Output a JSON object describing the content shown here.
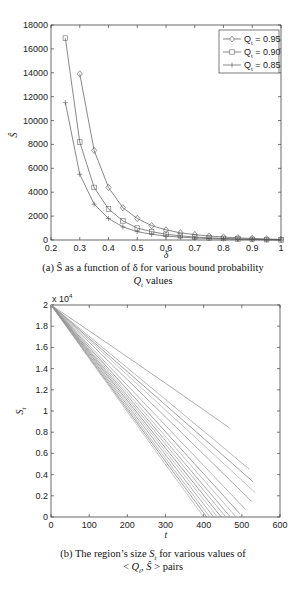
{
  "chart_data": [
    {
      "type": "line",
      "panel": "a",
      "xlabel": "δ",
      "ylabel": "Ŝ",
      "xlim": [
        0.2,
        1
      ],
      "ylim": [
        0,
        18000
      ],
      "xticks": [
        "0.2",
        "0.3",
        "0.4",
        "0.5",
        "0.6",
        "0.7",
        "0.8",
        "0.9",
        "1"
      ],
      "yticks": [
        "0",
        "2000",
        "4000",
        "6000",
        "8000",
        "10000",
        "12000",
        "14000",
        "16000",
        "18000"
      ],
      "grid": false,
      "legend_position": "upper right",
      "series": [
        {
          "name": "Q_t = 0.95",
          "marker": "diamond",
          "x": [
            0.3,
            0.35,
            0.4,
            0.45,
            0.5,
            0.55,
            0.6,
            0.65,
            0.7,
            0.75,
            0.8,
            0.85,
            0.9,
            0.95,
            1.0
          ],
          "y": [
            13900,
            7500,
            4400,
            2700,
            1800,
            1200,
            850,
            600,
            450,
            330,
            250,
            180,
            130,
            90,
            50
          ]
        },
        {
          "name": "Q_t = 0.90",
          "marker": "square",
          "x": [
            0.25,
            0.3,
            0.35,
            0.4,
            0.45,
            0.5,
            0.55,
            0.6,
            0.65,
            0.7,
            0.75,
            0.8,
            0.85,
            0.9,
            0.95,
            1.0
          ],
          "y": [
            16900,
            8200,
            4400,
            2600,
            1600,
            1000,
            700,
            480,
            350,
            250,
            180,
            130,
            90,
            60,
            30,
            10
          ]
        },
        {
          "name": "Q_t = 0.85",
          "marker": "plus",
          "x": [
            0.25,
            0.3,
            0.35,
            0.4,
            0.45,
            0.5,
            0.55,
            0.6,
            0.65,
            0.7,
            0.75,
            0.8,
            0.85,
            0.9,
            0.95,
            1.0
          ],
          "y": [
            11500,
            5500,
            3000,
            1800,
            1100,
            700,
            480,
            330,
            240,
            170,
            120,
            90,
            60,
            40,
            20,
            5
          ]
        }
      ],
      "caption_line1": "(a) Ŝ as a function of δ for various bound probability",
      "caption_line2": "Qt values"
    },
    {
      "type": "line",
      "panel": "b",
      "xlabel": "t",
      "ylabel": "St",
      "y_multiplier": "x 10^4",
      "xlim": [
        0,
        600
      ],
      "ylim": [
        0,
        2
      ],
      "xticks": [
        "0",
        "100",
        "200",
        "300",
        "400",
        "500",
        "600"
      ],
      "yticks": [
        "0",
        "0.2",
        "0.4",
        "0.6",
        "0.8",
        "1",
        "1.2",
        "1.4",
        "1.6",
        "1.8",
        "2"
      ],
      "grid": false,
      "series_note": "Family of ~16 near-linear decreasing curves from (0, 2e4)",
      "series": [
        {
          "start": [
            0,
            20000
          ],
          "end": [
            468,
            8400
          ]
        },
        {
          "start": [
            0,
            20000
          ],
          "end": [
            520,
            4500
          ]
        },
        {
          "start": [
            0,
            20000
          ],
          "end": [
            530,
            3300
          ]
        },
        {
          "start": [
            0,
            20000
          ],
          "end": [
            535,
            2300
          ]
        },
        {
          "start": [
            0,
            20000
          ],
          "end": [
            525,
            1500
          ]
        },
        {
          "start": [
            0,
            20000
          ],
          "end": [
            510,
            700
          ]
        },
        {
          "start": [
            0,
            20000
          ],
          "end": [
            495,
            300
          ]
        },
        {
          "start": [
            0,
            20000
          ],
          "end": [
            485,
            0
          ]
        },
        {
          "start": [
            0,
            20000
          ],
          "end": [
            470,
            0
          ]
        },
        {
          "start": [
            0,
            20000
          ],
          "end": [
            458,
            0
          ]
        },
        {
          "start": [
            0,
            20000
          ],
          "end": [
            446,
            0
          ]
        },
        {
          "start": [
            0,
            20000
          ],
          "end": [
            436,
            0
          ]
        },
        {
          "start": [
            0,
            20000
          ],
          "end": [
            426,
            0
          ]
        },
        {
          "start": [
            0,
            20000
          ],
          "end": [
            416,
            0
          ]
        },
        {
          "start": [
            0,
            20000
          ],
          "end": [
            408,
            0
          ]
        },
        {
          "start": [
            0,
            20000
          ],
          "end": [
            400,
            0
          ]
        }
      ],
      "caption_line1": "(b) The region's size St for various values of",
      "caption_line2": "< Qt, Ŝ > pairs"
    }
  ],
  "legend": {
    "items": [
      {
        "q": "Q",
        "sub": "t",
        "value": "= 0.95"
      },
      {
        "q": "Q",
        "sub": "t",
        "value": "= 0.90"
      },
      {
        "q": "Q",
        "sub": "t",
        "value": "= 0.85"
      }
    ]
  },
  "captions": {
    "a1": "(a) Ŝ as a function of δ for various bound probability",
    "a2": "Qt values",
    "b1": "(b) The region’s size St for various values of",
    "b2": "< Qt, Ŝ > pairs"
  },
  "labels": {
    "a_xlabel": "δ",
    "a_ylabel": "Ŝ",
    "b_xlabel": "t",
    "b_ylabel": "S",
    "b_ylabel_sub": "t",
    "b_multiplier": "x 10",
    "b_multiplier_exp": "4"
  }
}
